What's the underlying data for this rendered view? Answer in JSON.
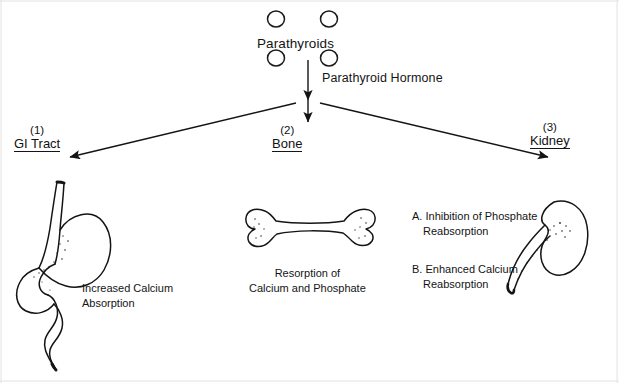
{
  "figure": {
    "background_color": "#ffffff",
    "ink_color": "#141414"
  },
  "source_gland": {
    "label": "Parathyroids",
    "icon": "parathyroid-gland-circles",
    "gland_count": 4
  },
  "hormone": {
    "label": "Parathyroid Hormone"
  },
  "arrows": {
    "center_arrow": "down-arrow",
    "left_arrow": "diagonal-arrow-left",
    "right_arrow": "diagonal-arrow-right"
  },
  "branches": [
    {
      "number": "(1)",
      "name": "GI Tract",
      "organ_icon": "stomach-intestine-illustration",
      "effect_lines": [
        "Increased  Calcium",
        "Absorption"
      ]
    },
    {
      "number": "(2)",
      "name": "Bone",
      "organ_icon": "long-bone-illustration",
      "effect_lines": [
        "Resorption  of",
        "Calcium  and Phosphate"
      ]
    },
    {
      "number": "(3)",
      "name": "Kidney",
      "organ_icon": "kidney-ureter-illustration",
      "effects": [
        {
          "marker": "A.",
          "line1": "Inhibition of  Phosphate",
          "line2": "Reabsorption"
        },
        {
          "marker": "B.",
          "line1": "Enhanced  Calcium",
          "line2": "Reabsorption"
        }
      ]
    }
  ]
}
